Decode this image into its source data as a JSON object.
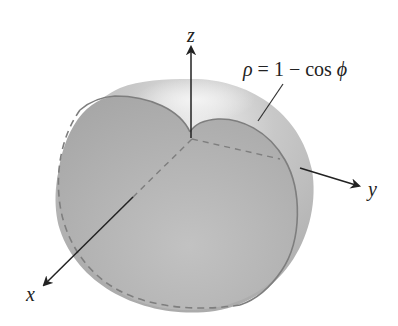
{
  "figure": {
    "equation": {
      "lhs": "ρ",
      "eq": " = 1 − cos ",
      "var": "ϕ"
    },
    "axes": {
      "x_label": "x",
      "y_label": "y",
      "z_label": "z"
    },
    "colors": {
      "surface": "#b5b5b5",
      "surface_light": "#e6e6e6",
      "cut_face": "#a9a9a9",
      "outline": "#7a7a7a",
      "axis": "#222222"
    }
  }
}
